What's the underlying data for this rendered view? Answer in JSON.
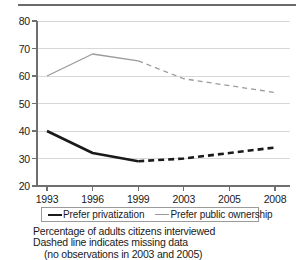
{
  "chart_data": {
    "type": "line",
    "title": "",
    "xlabel": "",
    "ylabel": "",
    "x": [
      "1993",
      "1996",
      "1999",
      "2003",
      "2005",
      "2008"
    ],
    "xtick_labels": [
      "1993",
      "1996",
      "1999",
      "2003",
      "2005",
      "2008"
    ],
    "ytick_labels": [
      "20",
      "30",
      "40",
      "50",
      "60",
      "70",
      "80"
    ],
    "ylim": [
      20,
      80
    ],
    "ystep": 10,
    "grid": "horizontal",
    "legend_position": "below-axes",
    "series": [
      {
        "name": "Prefer privatization",
        "color": "#1a1a1a",
        "style": "thick",
        "values": [
          40,
          32,
          29,
          30,
          32,
          34
        ],
        "solid_through": "1999",
        "dashed_from": "1999"
      },
      {
        "name": "Prefer public ownership",
        "color": "#9a9a9a",
        "style": "thin",
        "values": [
          60,
          68,
          65.5,
          59,
          56.5,
          54
        ],
        "solid_through": "1999",
        "dashed_from": "1999"
      }
    ],
    "annotations": [
      "Percentage of adults citizens interviewed",
      "Dashed line indicates missing data",
      "(no observations in 2003 and 2005)"
    ]
  },
  "legend": {
    "entries": [
      {
        "label": "Prefer privatization"
      },
      {
        "label": "Prefer public ownership"
      }
    ]
  },
  "caption": {
    "line1": "Percentage of adults citizens interviewed",
    "line2": "Dashed line indicates missing data",
    "line3": "(no observations in 2003 and 2005)"
  }
}
